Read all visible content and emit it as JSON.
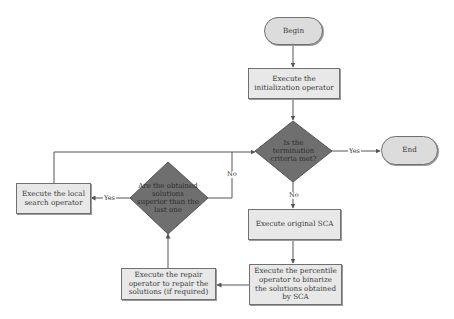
{
  "diagram": {
    "type": "flowchart",
    "nodes": {
      "begin": "Begin",
      "init": "Execute the initialization operator",
      "termination": "Is the termination criteria met?",
      "end": "End",
      "sca": "Execute original SCA",
      "percentile": "Execute the percentile operator to binarize the solutions obtained by SCA",
      "repair": "Execute the repair operator to repair the solutions (if required)",
      "superior": "Are the obtained solutions superior than the last one",
      "local_search": "Execute the local search operator"
    },
    "edge_labels": {
      "termination_yes": "Yes",
      "termination_no": "No",
      "superior_yes": "Yes",
      "superior_no": "No"
    },
    "colors": {
      "box_fill": "#e8e8e8",
      "pill_fill": "#dcdcdc",
      "diamond_fill": "#6f6f6f",
      "line": "#555555"
    }
  }
}
